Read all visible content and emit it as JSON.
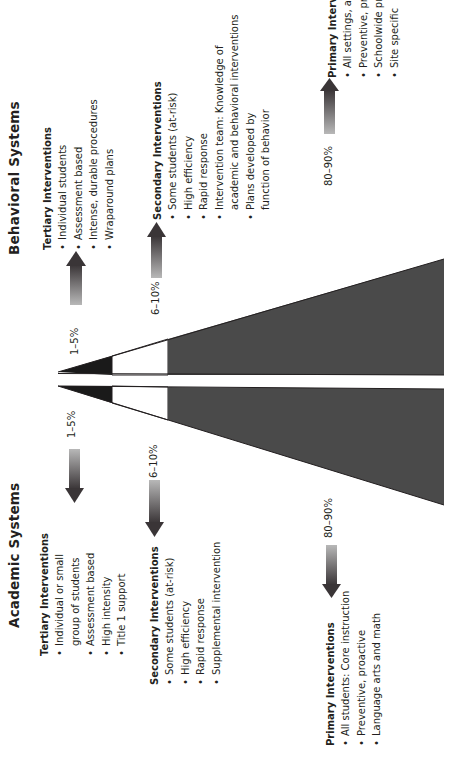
{
  "behavioral": {
    "title": "Behavioral Systems",
    "tertiary": {
      "heading": "Tertiary Interventions",
      "items": [
        "Individual students",
        "Assessment based",
        "Intense, durable procedures",
        "Wraparound plans"
      ],
      "percent": "1–5%"
    },
    "secondary": {
      "heading": "Secondary Interventions",
      "items": [
        "Some students (at-risk)",
        "High efficiency",
        "Rapid response",
        "Intervention team: Knowledge of",
        "academic and behavioral interventions",
        "Plans developed by",
        "function of behavior"
      ],
      "percent": "6–10%"
    },
    "primary": {
      "heading": "Primary Interventions",
      "items": [
        "All settings, all students",
        "Preventive, proactive",
        "Schoolwide programs",
        "Site specific"
      ],
      "percent": "80–90%"
    }
  },
  "academic": {
    "title": "Academic Systems",
    "tertiary": {
      "heading": "Tertiary Interventions",
      "items": [
        "Individual or small",
        "group of students",
        "Assessment based",
        "High intensity",
        "Title 1 support"
      ],
      "percent": "1–5%"
    },
    "secondary": {
      "heading": "Secondary Interventions",
      "items": [
        "Some students (at-risk)",
        "High efficiency",
        "Rapid response",
        "Supplemental intervention"
      ],
      "percent": "6–10%"
    },
    "primary": {
      "heading": "Primary Interventions",
      "items": [
        "All students: Core instruction",
        "Preventive, proactive",
        "Language arts and math"
      ],
      "percent": "80–90%"
    }
  },
  "colors": {
    "tertiary_fill": "#1a1a1a",
    "secondary_fill": "#ffffff",
    "primary_fill": "#4a4a4a",
    "arrow_dark": "#3a3537",
    "arrow_light": "#b0b0b0"
  }
}
